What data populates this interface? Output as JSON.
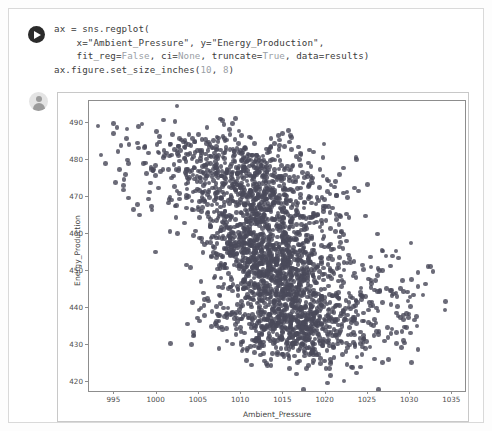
{
  "notebook": {
    "code_cell": {
      "run_icon": "run-play-icon",
      "lines": [
        [
          {
            "t": "ax = sns.regplot(",
            "k": false
          }
        ],
        [
          {
            "t": "    x=\"Ambient_Pressure\", y=\"Energy_Production\",",
            "k": false
          }
        ],
        [
          {
            "t": "    fit_reg=",
            "k": false
          },
          {
            "t": "False",
            "k": true
          },
          {
            "t": ", ci=",
            "k": false
          },
          {
            "t": "None",
            "k": true
          },
          {
            "t": ", truncate=",
            "k": false
          },
          {
            "t": "True",
            "k": true
          },
          {
            "t": ", data=results)",
            "k": false
          }
        ],
        [
          {
            "t": "ax.figure.set_size_inches(",
            "k": false
          },
          {
            "t": "10",
            "k": true
          },
          {
            "t": ", ",
            "k": false
          },
          {
            "t": "8",
            "k": true
          },
          {
            "t": ")",
            "k": false
          }
        ]
      ]
    },
    "output_cell": {
      "avatar_icon": "user-avatar-icon"
    }
  },
  "chart_data": {
    "type": "scatter",
    "title": "",
    "xlabel": "Ambient_Pressure",
    "ylabel": "Energy_Production",
    "xlim": [
      992.0,
      1036.5
    ],
    "ylim": [
      417.5,
      496.0
    ],
    "xticks": [
      995,
      1000,
      1005,
      1010,
      1015,
      1020,
      1025,
      1030,
      1035
    ],
    "yticks": [
      420,
      430,
      440,
      450,
      460,
      470,
      480,
      490
    ],
    "grid": false,
    "legend": null,
    "marker_color": "#4a4a5a",
    "marker_size": 4.6,
    "marker_opacity": 0.82,
    "n_points_drawn": 2600,
    "cluster_model": [
      {
        "name": "main-core",
        "weight": 0.5,
        "cx": 1014.0,
        "cy": 451.0,
        "sx": 4.2,
        "sy": 10.5,
        "rho": -0.45
      },
      {
        "name": "upper-band",
        "weight": 0.2,
        "cx": 1012.5,
        "cy": 474.0,
        "sx": 4.6,
        "sy": 7.0,
        "rho": -0.35
      },
      {
        "name": "lower-band",
        "weight": 0.17,
        "cx": 1016.5,
        "cy": 434.5,
        "sx": 5.0,
        "sy": 5.0,
        "rho": -0.25
      },
      {
        "name": "upper-left-tail",
        "weight": 0.08,
        "cx": 1004.5,
        "cy": 478.0,
        "sx": 4.5,
        "sy": 6.5,
        "rho": -0.3
      },
      {
        "name": "right-tail",
        "weight": 0.05,
        "cx": 1026.0,
        "cy": 442.0,
        "sx": 4.0,
        "sy": 8.0,
        "rho": -0.2
      }
    ]
  }
}
